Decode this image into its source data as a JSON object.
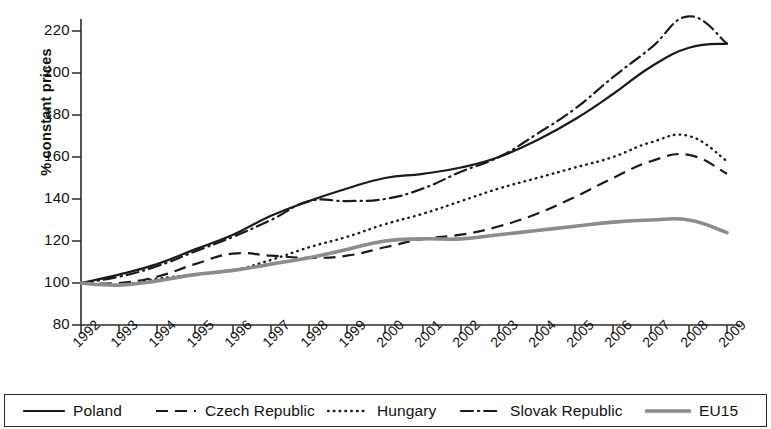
{
  "chart_data": {
    "type": "line",
    "title": "",
    "xlabel": "",
    "ylabel": "% constant prices",
    "x": [
      1992,
      1993,
      1994,
      1995,
      1996,
      1997,
      1998,
      1999,
      2000,
      2001,
      2002,
      2003,
      2004,
      2005,
      2006,
      2007,
      2008,
      2009
    ],
    "categories": [
      "1992",
      "1993",
      "1994",
      "1995",
      "1996",
      "1997",
      "1998",
      "1999",
      "2000",
      "2001",
      "2002",
      "2003",
      "2004",
      "2005",
      "2006",
      "2007",
      "2008",
      "2009"
    ],
    "xlim": [
      1992,
      2009
    ],
    "ylim": [
      80,
      230
    ],
    "yticks": [
      80,
      100,
      120,
      140,
      160,
      180,
      200,
      220
    ],
    "ytick_labels": [
      "80",
      "100",
      "120",
      "140",
      "160",
      "180",
      "200",
      "220"
    ],
    "grid": false,
    "legend_position": "bottom",
    "series": [
      {
        "name": "Poland",
        "style": "solid",
        "color": "#1a1a1a",
        "values": [
          100,
          104,
          109,
          116,
          123,
          132,
          139,
          145,
          150,
          152,
          155,
          160,
          168,
          178,
          190,
          203,
          212,
          214
        ]
      },
      {
        "name": "Czech Republic",
        "style": "dashed",
        "color": "#1a1a1a",
        "values": [
          100,
          100,
          103,
          109,
          114,
          113,
          112,
          113,
          117,
          121,
          123,
          127,
          133,
          141,
          150,
          158,
          161,
          152
        ]
      },
      {
        "name": "Hungary",
        "style": "dotted",
        "color": "#1a1a1a",
        "values": [
          100,
          99,
          102,
          104,
          106,
          111,
          117,
          122,
          128,
          133,
          139,
          145,
          150,
          155,
          160,
          167,
          170,
          158
        ]
      },
      {
        "name": "Slovak Republic",
        "style": "dash-dot",
        "color": "#1a1a1a",
        "values": [
          100,
          103,
          108,
          115,
          122,
          130,
          139,
          139,
          140,
          145,
          153,
          160,
          171,
          183,
          198,
          212,
          227,
          214
        ]
      },
      {
        "name": "EU15",
        "style": "solid-thick",
        "color": "#8c8c8c",
        "values": [
          100,
          99,
          101,
          104,
          106,
          109,
          112,
          116,
          120,
          121,
          121,
          123,
          125,
          127,
          129,
          130,
          130,
          124
        ]
      }
    ]
  },
  "axis": {
    "ylabel": "% constant prices",
    "ytick_labels": [
      "220",
      "200",
      "180",
      "160",
      "140",
      "120",
      "100",
      "80"
    ],
    "xtick_labels": [
      "1992",
      "1993",
      "1994",
      "1995",
      "1996",
      "1997",
      "1998",
      "1999",
      "2000",
      "2001",
      "2002",
      "2003",
      "2004",
      "2005",
      "2006",
      "2007",
      "2008",
      "2009"
    ]
  },
  "legend": {
    "items": [
      {
        "label": "Poland",
        "style": "solid"
      },
      {
        "label": "Czech Republic",
        "style": "dashed"
      },
      {
        "label": "Hungary",
        "style": "dotted"
      },
      {
        "label": "Slovak Republic",
        "style": "dash-dot"
      },
      {
        "label": "EU15",
        "style": "solid-thick"
      }
    ]
  }
}
